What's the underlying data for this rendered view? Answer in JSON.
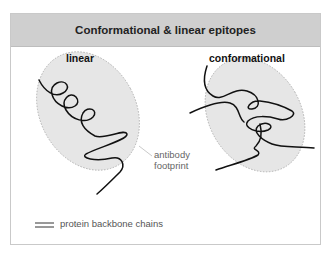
{
  "title": "Conformational & linear epitopes",
  "panels": {
    "linear": {
      "label": "linear"
    },
    "conformational": {
      "label": "conformational"
    }
  },
  "annotation": {
    "line1": "antibody",
    "line2": "footprint"
  },
  "legend": {
    "icon": "double-line-icon",
    "label": "protein backbone chains"
  },
  "colors": {
    "header_bg": "#cfcfcf",
    "footprint_fill": "#e6e6e6",
    "footprint_border": "#b0b0b0",
    "chain": "#111111"
  }
}
